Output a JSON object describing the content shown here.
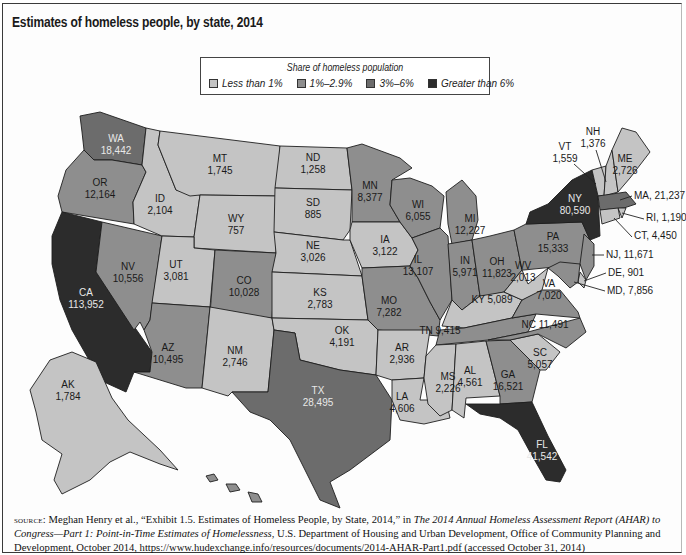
{
  "figure": {
    "title": "Estimates of homeless people, by state, 2014"
  },
  "legend": {
    "title": "Share of homeless population",
    "items": [
      {
        "key": "c1",
        "label": "Less than 1%",
        "color": "#c4c4c4"
      },
      {
        "key": "c2",
        "label": "1%–2.9%",
        "color": "#8e8e8e"
      },
      {
        "key": "c3",
        "label": "3%–6%",
        "color": "#6c6c6c"
      },
      {
        "key": "c4",
        "label": "Greater than 6%",
        "color": "#2c2c2c"
      }
    ]
  },
  "map_data": {
    "type": "choropleth",
    "variable": "Estimated homeless people",
    "year": 2014,
    "states": [
      {
        "abbr": "WA",
        "value": 18442,
        "label": "18,442",
        "category": "c3"
      },
      {
        "abbr": "OR",
        "value": 12164,
        "label": "12,164",
        "category": "c2"
      },
      {
        "abbr": "CA",
        "value": 113952,
        "label": "113,952",
        "category": "c4"
      },
      {
        "abbr": "NV",
        "value": 10556,
        "label": "10,556",
        "category": "c2"
      },
      {
        "abbr": "ID",
        "value": 2104,
        "label": "2,104",
        "category": "c1"
      },
      {
        "abbr": "MT",
        "value": 1745,
        "label": "1,745",
        "category": "c1"
      },
      {
        "abbr": "WY",
        "value": 757,
        "label": "757",
        "category": "c1"
      },
      {
        "abbr": "UT",
        "value": 3081,
        "label": "3,081",
        "category": "c1"
      },
      {
        "abbr": "AZ",
        "value": 10495,
        "label": "10,495",
        "category": "c2"
      },
      {
        "abbr": "CO",
        "value": 10028,
        "label": "10,028",
        "category": "c2"
      },
      {
        "abbr": "NM",
        "value": 2746,
        "label": "2,746",
        "category": "c1"
      },
      {
        "abbr": "ND",
        "value": 1258,
        "label": "1,258",
        "category": "c1"
      },
      {
        "abbr": "SD",
        "value": 885,
        "label": "885",
        "category": "c1"
      },
      {
        "abbr": "NE",
        "value": 3026,
        "label": "3,026",
        "category": "c1"
      },
      {
        "abbr": "KS",
        "value": 2783,
        "label": "2,783",
        "category": "c1"
      },
      {
        "abbr": "OK",
        "value": 4191,
        "label": "4,191",
        "category": "c1"
      },
      {
        "abbr": "TX",
        "value": 28495,
        "label": "28,495",
        "category": "c3"
      },
      {
        "abbr": "MN",
        "value": 8377,
        "label": "8,377",
        "category": "c2"
      },
      {
        "abbr": "IA",
        "value": 3122,
        "label": "3,122",
        "category": "c1"
      },
      {
        "abbr": "MO",
        "value": 7282,
        "label": "7,282",
        "category": "c2"
      },
      {
        "abbr": "AR",
        "value": 2936,
        "label": "2,936",
        "category": "c1"
      },
      {
        "abbr": "LA",
        "value": 4606,
        "label": "4,606",
        "category": "c1"
      },
      {
        "abbr": "WI",
        "value": 6055,
        "label": "6,055",
        "category": "c2"
      },
      {
        "abbr": "IL",
        "value": 13107,
        "label": "13,107",
        "category": "c2"
      },
      {
        "abbr": "MI",
        "value": 12227,
        "label": "12,227",
        "category": "c2"
      },
      {
        "abbr": "IN",
        "value": 5971,
        "label": "5,971",
        "category": "c2"
      },
      {
        "abbr": "OH",
        "value": 11823,
        "label": "11,823",
        "category": "c2"
      },
      {
        "abbr": "KY",
        "value": 5089,
        "label": "KY 5,089",
        "category": "c1"
      },
      {
        "abbr": "TN",
        "value": 9415,
        "label": "TN 9,415",
        "category": "c2"
      },
      {
        "abbr": "MS",
        "value": 2226,
        "label": "2,226",
        "category": "c1"
      },
      {
        "abbr": "AL",
        "value": 4561,
        "label": "4,561",
        "category": "c1"
      },
      {
        "abbr": "GA",
        "value": 16521,
        "label": "16,521",
        "category": "c2"
      },
      {
        "abbr": "FL",
        "value": 41542,
        "label": "41,542",
        "category": "c4"
      },
      {
        "abbr": "SC",
        "value": 5057,
        "label": "5,057",
        "category": "c1"
      },
      {
        "abbr": "NC",
        "value": 11491,
        "label": "NC 11,491",
        "category": "c2"
      },
      {
        "abbr": "VA",
        "value": 7020,
        "label": "7,020",
        "category": "c2"
      },
      {
        "abbr": "WV",
        "value": 2013,
        "label": "2,013",
        "category": "c1"
      },
      {
        "abbr": "PA",
        "value": 15333,
        "label": "15,333",
        "category": "c2"
      },
      {
        "abbr": "NY",
        "value": 80590,
        "label": "80,590",
        "category": "c4"
      },
      {
        "abbr": "VT",
        "value": 1559,
        "label": "1,559",
        "category": "c1"
      },
      {
        "abbr": "NH",
        "value": 1376,
        "label": "1,376",
        "category": "c1"
      },
      {
        "abbr": "ME",
        "value": 2726,
        "label": "2,726",
        "category": "c1"
      },
      {
        "abbr": "MA",
        "value": 21237,
        "label": "MA, 21,237",
        "category": "c3"
      },
      {
        "abbr": "RI",
        "value": 1190,
        "label": "RI, 1,190",
        "category": "c1"
      },
      {
        "abbr": "CT",
        "value": 4450,
        "label": "CT, 4,450",
        "category": "c1"
      },
      {
        "abbr": "NJ",
        "value": 11671,
        "label": "NJ, 11,671",
        "category": "c2"
      },
      {
        "abbr": "DE",
        "value": 901,
        "label": "DE, 901",
        "category": "c1"
      },
      {
        "abbr": "MD",
        "value": 7856,
        "label": "MD, 7,856",
        "category": "c2"
      },
      {
        "abbr": "DC",
        "value": 7748,
        "label": "DC, 7,748",
        "category": "c2"
      },
      {
        "abbr": "AK",
        "value": 1784,
        "label": "1,784",
        "category": "c1"
      },
      {
        "abbr": "HI",
        "value": null,
        "label": "",
        "category": "c2"
      }
    ]
  },
  "source": {
    "prefix": "source:",
    "text1": " Meghan Henry et al., “Exhibit 1.5. Estimates of Homeless People, by State, 2014,” in ",
    "italic1": "The 2014 Annual Homeless Assessment Report (AHAR) to Congress—Part 1: Point-in-Time Estimates of Homelessness",
    "text2": ", U.S. Department of Housing and Urban Development, Office of Community Planning and Development, October 2014, https://www.hudexchange.info/resources/documents/2014-AHAR-Part1.pdf (accessed October 31, 2014)"
  }
}
